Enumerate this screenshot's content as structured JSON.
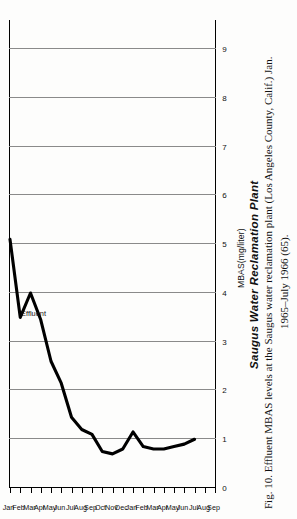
{
  "figure": {
    "chart_title": "Saugus Water Reclamation Plant",
    "series_label": "Effluent",
    "caption_line1": "Fig. 10.  Effluent MBAS levels at the Saugus water reclamation plant (Los Angeles County, Calif.) Jan.",
    "caption_line2": "1965–July 1966 (65)."
  },
  "chart_data": {
    "type": "line",
    "title": "Saugus Water Reclamation Plant",
    "xlabel": "",
    "ylabel": "MBAS(mg/liter)",
    "ylim": [
      0,
      9.6
    ],
    "yticks": [
      0,
      1,
      2,
      3,
      4,
      5,
      6,
      7,
      8,
      9
    ],
    "ytick_labels": [
      "0",
      "1",
      "2",
      "3",
      "4",
      "5",
      "6",
      "7",
      "8",
      "9"
    ],
    "grid": "vertical-on-value-axis",
    "legend": "inline-annotation",
    "orientation": "rotated-90-ccw-scan",
    "x": [
      "Jan",
      "Feb",
      "Mar",
      "Apr",
      "May",
      "Jun",
      "Jul",
      "Aug",
      "Sep",
      "Oct",
      "Nov",
      "Dec",
      "Jan",
      "Feb",
      "Mar",
      "Apr",
      "May",
      "Jun",
      "Jul",
      "Aug",
      "Sep"
    ],
    "xtick_labels": [
      "Jan",
      "Feb",
      "Mar",
      "Apr",
      "May",
      "Jun",
      "Jul",
      "Aug",
      "Sep",
      "Oct",
      "Nov",
      "Dec",
      "Jan",
      "Feb",
      "Mar",
      "Apr",
      "May",
      "Jun",
      "Jul",
      "Aug",
      "Sep"
    ],
    "year_groups": [
      {
        "label": "1965",
        "start": "Jan",
        "end": "Dec"
      },
      {
        "label": "1966",
        "start": "Jan",
        "end": "Sep"
      }
    ],
    "series": [
      {
        "name": "Effluent",
        "values": [
          5.1,
          3.5,
          4.0,
          3.45,
          2.6,
          2.15,
          1.45,
          1.2,
          1.1,
          0.75,
          0.7,
          0.8,
          1.15,
          0.85,
          0.8,
          0.8,
          0.85,
          0.9,
          1.0,
          null,
          null
        ]
      }
    ],
    "annotations": [
      {
        "text": "Effluent",
        "near_x": "Apr",
        "near_y": 3.6
      }
    ]
  },
  "ylabels": [
    "9",
    "8",
    "7",
    "6",
    "5",
    "4",
    "3",
    "2",
    "1",
    "0"
  ],
  "xlabels": [
    "Jan",
    "Feb",
    "Mar",
    "Apr",
    "May",
    "Jun",
    "Jul",
    "Aug",
    "Sep",
    "Oct",
    "Nov",
    "Dec",
    "Jan",
    "Feb",
    "Mar",
    "Apr",
    "May",
    "Jun",
    "Jul",
    "Aug",
    "Sep"
  ],
  "axis": {
    "y_title": "MBAS(mg/liter)"
  },
  "years": [
    "1965",
    "1966"
  ]
}
